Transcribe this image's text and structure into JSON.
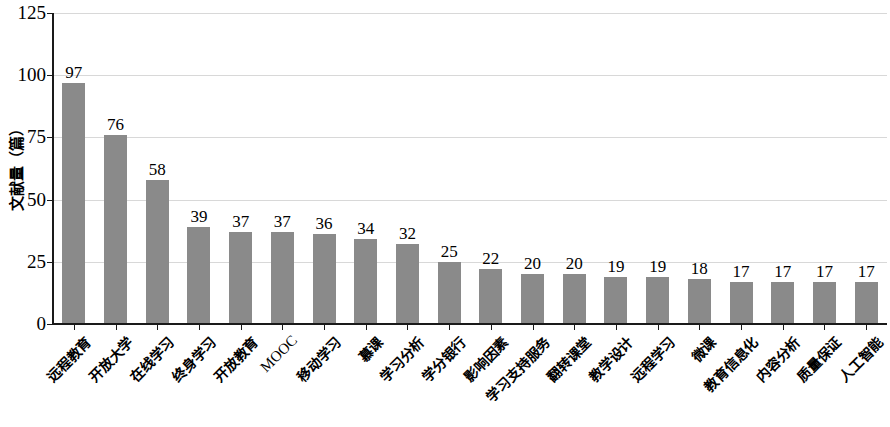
{
  "chart_data": {
    "type": "bar",
    "title": "",
    "subtitle": "",
    "xlabel": "",
    "ylabel": "文献量（篇）",
    "ylim": [
      0,
      125
    ],
    "ytick_labels": [
      "0",
      "25",
      "50",
      "75",
      "100",
      "125"
    ],
    "ytick_values": [
      0,
      25,
      50,
      75,
      100,
      125
    ],
    "grid": "horizontal",
    "legend": "none",
    "bar_color": "#8a8a8a",
    "gridline_color": "#d8d8d8",
    "axis_color": "#1a1a1a",
    "categories": [
      "远程教育",
      "开放大学",
      "在线学习",
      "终身学习",
      "开放教育",
      "MOOC",
      "移动学习",
      "慕课",
      "学习分析",
      "学分银行",
      "影响因素",
      "学习支持服务",
      "翻转课堂",
      "教学设计",
      "远程学习",
      "微课",
      "教育信息化",
      "内容分析",
      "质量保证",
      "人工智能"
    ],
    "values": [
      97,
      76,
      58,
      39,
      37,
      37,
      36,
      34,
      32,
      25,
      22,
      20,
      20,
      19,
      19,
      18,
      17,
      17,
      17,
      17
    ],
    "value_labels": [
      "97",
      "76",
      "58",
      "39",
      "37",
      "37",
      "36",
      "34",
      "32",
      "25",
      "22",
      "20",
      "20",
      "19",
      "19",
      "18",
      "17",
      "17",
      "17",
      "17"
    ]
  }
}
